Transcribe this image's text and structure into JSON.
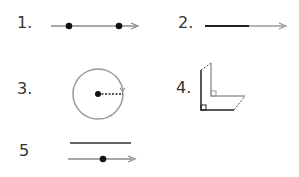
{
  "items": [
    {
      "label": "1.",
      "description": "ray with two points"
    },
    {
      "label": "2.",
      "description": "ray (segment continuing into arrow)"
    },
    {
      "label": "3.",
      "description": "circle with center point and dashed radius"
    },
    {
      "label": "4.",
      "description": "two L-shaped right angles (translation)"
    },
    {
      "label": "5",
      "description": "line segment above a ray with one point"
    }
  ],
  "colors": {
    "dark": "#222222",
    "gray": "#999999",
    "text": "#333333"
  }
}
